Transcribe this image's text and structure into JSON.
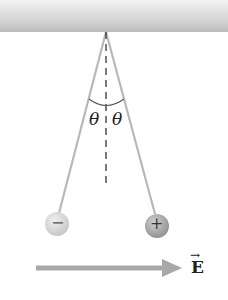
{
  "diagram": {
    "labels": {
      "theta_left": "θ",
      "theta_right": "θ",
      "field": "E",
      "field_arrow": "→"
    },
    "charges": {
      "left": "−",
      "right": "+"
    },
    "colors": {
      "ceiling": "#d0d0d0",
      "string": "#b8b8b8",
      "arrow": "#a8a8a8",
      "ball_left": "#d8d8d8",
      "ball_right": "#a0a0a0"
    }
  }
}
